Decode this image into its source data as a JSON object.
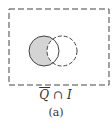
{
  "diagram": {
    "type": "venn",
    "universe_border": "dashed",
    "sets": [
      {
        "name": "Q",
        "position": "left",
        "border": "solid"
      },
      {
        "name": "I",
        "position": "right",
        "border": "dashed"
      }
    ],
    "shaded_region": "Q complement-excluded: left circle minus intersection",
    "shade_color": "#d4d4d4",
    "line_color": "#444444"
  },
  "expression": {
    "left": "Q",
    "operator": "∩",
    "right": "I",
    "left_overline": true
  },
  "caption": "(a)"
}
